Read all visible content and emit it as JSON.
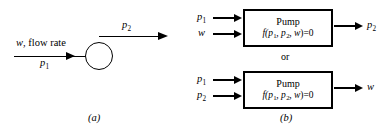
{
  "figure": {
    "panel_a": {
      "caption": "(a)",
      "pump_symbol": "circle",
      "labels": {
        "flow_rate_prefix": "w",
        "flow_rate_text": ", flow rate",
        "inlet_pressure": "p",
        "inlet_pressure_sub": "1",
        "outlet_pressure": "p",
        "outlet_pressure_sub": "2"
      }
    },
    "panel_b": {
      "caption": "(b)",
      "connector_label": "or",
      "blocks": [
        {
          "title": "Pump",
          "equation_fn": "f",
          "equation_body": "(p",
          "equation_sub1": "1",
          "equation_mid": ", p",
          "equation_sub2": "2",
          "equation_tail": ", w",
          "equation_end": ")=0",
          "inputs": [
            {
              "symbol": "p",
              "sub": "1"
            },
            {
              "symbol": "w",
              "sub": ""
            }
          ],
          "outputs": [
            {
              "symbol": "p",
              "sub": "2"
            }
          ]
        },
        {
          "title": "Pump",
          "equation_fn": "f",
          "equation_body": "(p",
          "equation_sub1": "1",
          "equation_mid": ", p",
          "equation_sub2": "2",
          "equation_tail": ", w",
          "equation_end": ")=0",
          "inputs": [
            {
              "symbol": "p",
              "sub": "1"
            },
            {
              "symbol": "p",
              "sub": "2"
            }
          ],
          "outputs": [
            {
              "symbol": "w",
              "sub": ""
            }
          ]
        }
      ]
    },
    "colors": {
      "stroke": "#000000",
      "background": "#ffffff"
    }
  }
}
